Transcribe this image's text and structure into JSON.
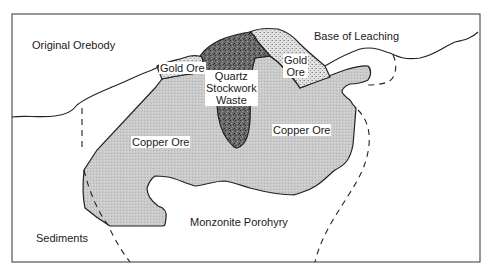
{
  "diagram": {
    "type": "geologic-cross-section",
    "labels": {
      "original_orebody": "Original Orebody",
      "base_of_leaching": "Base of Leaching",
      "gold_ore_left": "Gold Ore",
      "gold_ore_right": "Gold\nOre",
      "quartz_stockwork_waste": "Quartz\nStockwork\nWaste",
      "copper_ore_left": "Copper Ore",
      "copper_ore_right": "Copper Ore",
      "monzonite_porphyry": "Monzonite Porohyry",
      "sediments": "Sediments"
    },
    "colors": {
      "frame": "#333333",
      "outline": "#222222",
      "copper_ore_fill": "#c8c8c8",
      "gold_ore_fill": "#dcdcdc",
      "quartz_fill": "#6e6e6e",
      "background": "#ffffff"
    }
  }
}
